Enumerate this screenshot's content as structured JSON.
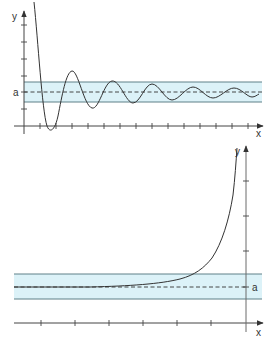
{
  "colors": {
    "band_fill": "#dcf2f8",
    "band_edge": "#5f8088",
    "axis": "#444444",
    "curve": "#333333",
    "dashed": "#333333"
  },
  "top_graph": {
    "y_label": "y",
    "x_label": "x",
    "a_label": "a",
    "description": "Damped oscillation converging to the horizontal asymptote y = a, staying within the epsilon band"
  },
  "bottom_graph": {
    "y_label": "y",
    "x_label": "x",
    "a_label": "a",
    "description": "Curve approaching y = a as x goes to negative infinity, rising steeply near the y-axis"
  }
}
